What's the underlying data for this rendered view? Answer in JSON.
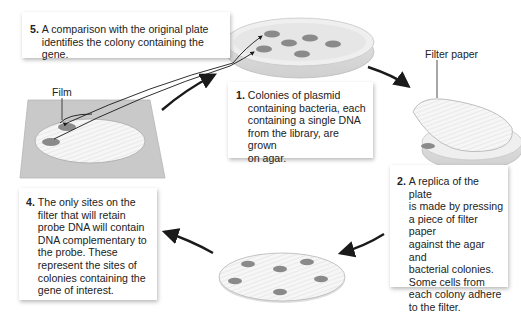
{
  "diagram": {
    "type": "process-cycle",
    "labels": {
      "film": "Film",
      "filter_paper": "Filter paper"
    },
    "steps": [
      {
        "number": "1.",
        "text": "Colonies of plasmid\ncontaining bacteria, each\ncontaining a single DNA\nfrom the library, are grown\non agar."
      },
      {
        "number": "2.",
        "text": "A replica of the plate\nis made by pressing\na piece of filter paper\nagainst the agar and\nbacterial colonies.\nSome cells from\neach colony adhere\nto the filter."
      },
      {
        "number": "4.",
        "text": "The only sites on the\nfilter that will retain\nprobe DNA will contain\nDNA complementary to\nthe probe. These\nrepresent the sites of\ncolonies containing the\ngene of interest."
      },
      {
        "number": "5.",
        "text": "A comparison with the original plate\nidentifies the colony containing the gene."
      }
    ],
    "colors": {
      "film": "#c9c9c9",
      "plate": "#eeeeee",
      "colony": "#8a8a8a",
      "arrow": "#1a1a1a"
    }
  }
}
